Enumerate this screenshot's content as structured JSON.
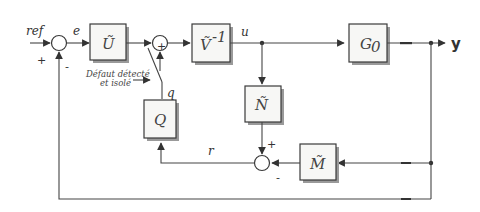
{
  "diagram": {
    "type": "block-diagram",
    "signals": {
      "input": "ref",
      "error": "e",
      "control": "u",
      "output": "y",
      "residual": "r",
      "switch_signal": "q"
    },
    "blocks": {
      "U": "Ũ",
      "V_inv": "Ṽ",
      "V_inv_exp": "-1",
      "G0": "G",
      "G0_sub": "0",
      "N": "Ñ",
      "M": "M̃",
      "Q": "Q"
    },
    "signs": {
      "sum1_ref": "+",
      "sum1_feedback": "-",
      "sum2_bottom": "+",
      "sum3_top": "+",
      "sum3_left": "-"
    },
    "annotation": {
      "line1": "Défaut détecté",
      "line2": "et isolé"
    }
  }
}
